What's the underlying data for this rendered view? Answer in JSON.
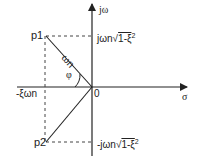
{
  "diagram": {
    "type": "s-plane pole diagram",
    "axes": {
      "vertical_label": "jω",
      "horizontal_label": "σ",
      "origin_label": "0"
    },
    "points": {
      "p1": "p1",
      "p2": "p2"
    },
    "labels": {
      "upper_imag": "jωn",
      "upper_imag_root": "1-ξ",
      "upper_imag_exp": "2",
      "lower_imag": "-jωn",
      "lower_imag_root": "1-ξ",
      "lower_imag_exp": "2",
      "real_part": "-ξωn",
      "magnitude": "ωn",
      "angle": "φ"
    },
    "colors": {
      "line": "#222222",
      "background": "#ffffff"
    }
  }
}
